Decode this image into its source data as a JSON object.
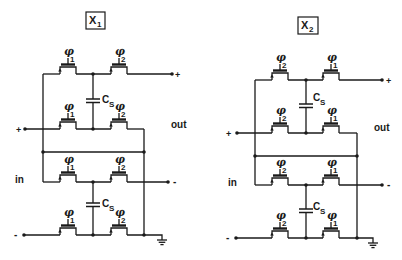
{
  "diagram": {
    "type": "switched-capacitor circuit schematic",
    "circuits": [
      {
        "id": "x1",
        "title_main": "X",
        "title_sub": "1",
        "rows": [
          {
            "gates": [
              {
                "main": "φ",
                "sub": "1"
              },
              {
                "main": "φ",
                "sub": "2"
              }
            ],
            "right_terminal": "+"
          },
          {
            "gates": [
              {
                "main": "φ",
                "sub": "1"
              },
              {
                "main": "φ",
                "sub": "2"
              }
            ],
            "left_terminal": "+"
          },
          {
            "gates": [
              {
                "main": "φ",
                "sub": "1"
              },
              {
                "main": "φ",
                "sub": "2"
              }
            ],
            "right_terminal": "-"
          },
          {
            "gates": [
              {
                "main": "φ",
                "sub": "1"
              },
              {
                "main": "φ",
                "sub": "2"
              }
            ],
            "left_terminal": "-"
          }
        ],
        "capacitors": [
          {
            "main": "C",
            "sub": "S"
          },
          {
            "main": "C",
            "sub": "S"
          }
        ],
        "out_label": "out",
        "in_label": "in",
        "ground": "ground"
      },
      {
        "id": "x2",
        "title_main": "X",
        "title_sub": "2",
        "rows": [
          {
            "gates": [
              {
                "main": "φ",
                "sub": "2"
              },
              {
                "main": "φ",
                "sub": "1"
              }
            ],
            "right_terminal": "+"
          },
          {
            "gates": [
              {
                "main": "φ",
                "sub": "2"
              },
              {
                "main": "φ",
                "sub": "1"
              }
            ],
            "left_terminal": "+"
          },
          {
            "gates": [
              {
                "main": "φ",
                "sub": "2"
              },
              {
                "main": "φ",
                "sub": "1"
              }
            ],
            "right_terminal": "-"
          },
          {
            "gates": [
              {
                "main": "φ",
                "sub": "2"
              },
              {
                "main": "φ",
                "sub": "1"
              }
            ],
            "left_terminal": "-"
          }
        ],
        "capacitors": [
          {
            "main": "C",
            "sub": "S"
          },
          {
            "main": "C",
            "sub": "S"
          }
        ],
        "out_label": "out",
        "in_label": "in",
        "ground": "ground"
      }
    ]
  }
}
